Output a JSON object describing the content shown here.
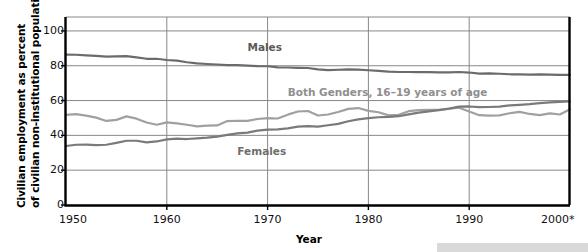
{
  "chart_data": {
    "type": "line",
    "title": "",
    "xlabel": "Year",
    "ylabel": "Civilian employment as percent of civilian non-institutional population",
    "ylabel_line1": "Civilian employment as percent",
    "ylabel_line2": "of civilian non-institutional population",
    "xlim": [
      1950,
      2000
    ],
    "ylim": [
      0,
      108
    ],
    "yticks": [
      0,
      20,
      40,
      60,
      80,
      100
    ],
    "ytick_labels": [
      "0",
      "20",
      "40",
      "60",
      "80",
      "100"
    ],
    "xticks": [
      1950,
      1960,
      1970,
      1980,
      1990,
      2000
    ],
    "xtick_labels": [
      "1950",
      "1960",
      "1970",
      "1980",
      "1990",
      "2000*"
    ],
    "grid": true,
    "legend": "inline-annotations",
    "colors": {
      "males": "#6b6b6b",
      "both_genders": "#a0a0a0",
      "females": "#7a7a7a",
      "gridline": "#888888",
      "axis": "#000000",
      "background": "#ffffff",
      "footer_bar": "#d9d9d9"
    },
    "annotations": [
      {
        "text": "Males",
        "x": 1968,
        "y": 91,
        "series": "males"
      },
      {
        "text": "Both Genders, 16–19 years of age",
        "x": 1972,
        "y": 65,
        "series": "both_genders"
      },
      {
        "text": "Females",
        "x": 1967,
        "y": 31,
        "series": "females"
      }
    ],
    "x": [
      1950,
      1951,
      1952,
      1953,
      1954,
      1955,
      1956,
      1957,
      1958,
      1959,
      1960,
      1961,
      1962,
      1963,
      1964,
      1965,
      1966,
      1967,
      1968,
      1969,
      1970,
      1971,
      1972,
      1973,
      1974,
      1975,
      1976,
      1977,
      1978,
      1979,
      1980,
      1981,
      1982,
      1983,
      1984,
      1985,
      1986,
      1987,
      1988,
      1989,
      1990,
      1991,
      1992,
      1993,
      1994,
      1995,
      1996,
      1997,
      1998,
      1999,
      2000
    ],
    "series": [
      {
        "name": "Males",
        "color": "#6b6b6b",
        "values": [
          86.4,
          86.3,
          86.0,
          85.7,
          85.2,
          85.4,
          85.5,
          84.8,
          84.0,
          84.0,
          83.3,
          82.9,
          82.0,
          81.4,
          81.0,
          80.7,
          80.4,
          80.4,
          80.1,
          79.8,
          79.7,
          79.1,
          79.0,
          78.8,
          78.7,
          77.9,
          77.5,
          77.7,
          77.9,
          77.8,
          77.4,
          77.0,
          76.6,
          76.4,
          76.4,
          76.3,
          76.3,
          76.2,
          76.2,
          76.4,
          76.1,
          75.5,
          75.6,
          75.4,
          75.1,
          75.0,
          74.9,
          75.0,
          74.9,
          74.7,
          74.8
        ]
      },
      {
        "name": "Both Genders, 16–19 years of age",
        "color": "#a0a0a0",
        "values": [
          51.8,
          52.2,
          51.3,
          50.2,
          48.3,
          48.9,
          50.9,
          49.6,
          47.4,
          46.1,
          47.5,
          46.9,
          46.1,
          45.2,
          45.6,
          45.7,
          48.2,
          48.4,
          48.3,
          49.4,
          49.9,
          49.7,
          51.9,
          53.7,
          54.0,
          51.4,
          52.0,
          53.4,
          55.2,
          55.7,
          54.1,
          53.3,
          51.5,
          51.8,
          53.9,
          54.5,
          54.7,
          54.7,
          55.3,
          55.9,
          53.7,
          51.6,
          51.3,
          51.5,
          52.7,
          53.5,
          52.3,
          51.6,
          52.6,
          52.0,
          55.0
        ]
      },
      {
        "name": "Females",
        "color": "#7a7a7a",
        "values": [
          33.9,
          34.6,
          34.7,
          34.4,
          34.6,
          35.7,
          36.9,
          36.9,
          36.0,
          36.5,
          37.7,
          38.1,
          37.9,
          38.3,
          38.7,
          39.3,
          40.3,
          41.1,
          41.6,
          42.7,
          43.3,
          43.4,
          44.0,
          45.0,
          45.3,
          45.0,
          45.8,
          46.6,
          48.1,
          49.2,
          49.9,
          50.4,
          50.6,
          51.0,
          52.1,
          53.1,
          53.8,
          54.5,
          55.4,
          56.5,
          56.6,
          56.2,
          56.3,
          56.5,
          57.2,
          57.5,
          57.9,
          58.5,
          59.0,
          59.2,
          59.5
        ]
      }
    ]
  }
}
